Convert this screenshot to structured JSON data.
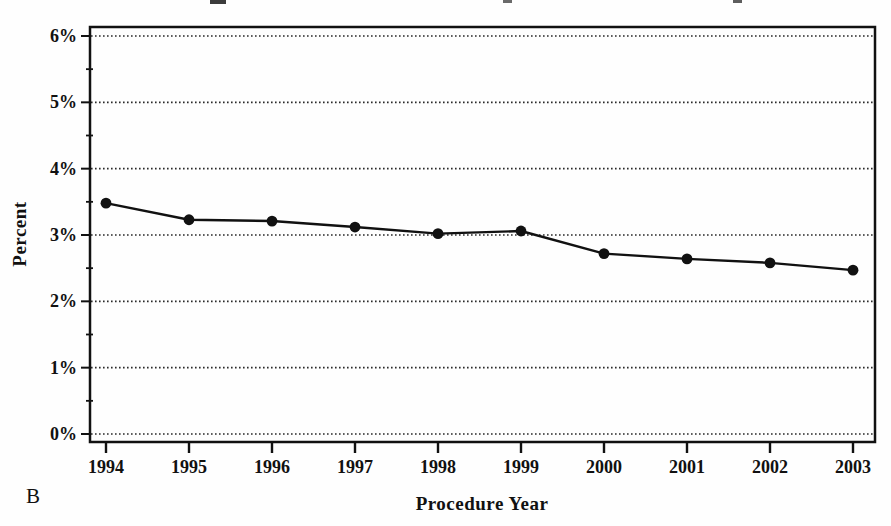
{
  "figure": {
    "panel_label": "B"
  },
  "chart_data": {
    "type": "line",
    "title": "",
    "xlabel": "Procedure Year",
    "ylabel": "Percent",
    "categories": [
      "1994",
      "1995",
      "1996",
      "1997",
      "1998",
      "1999",
      "2000",
      "2001",
      "2002",
      "2003"
    ],
    "series": [
      {
        "name": "Percent",
        "values": [
          3.48,
          3.23,
          3.21,
          3.12,
          3.02,
          3.06,
          2.72,
          2.64,
          2.58,
          2.47
        ]
      }
    ],
    "ylim": [
      0,
      6
    ],
    "ytick_labels": [
      "0%",
      "1%",
      "2%",
      "3%",
      "4%",
      "5%",
      "6%"
    ],
    "ytick_step": 1,
    "minor_ytick_step": 0.5,
    "grid": "horizontal-dotted",
    "legend": "none",
    "marker": "filled-circle",
    "line_color": "#111111",
    "grid_color": "#2a2a2a",
    "frame_color": "#111111",
    "background": "#ffffff"
  }
}
